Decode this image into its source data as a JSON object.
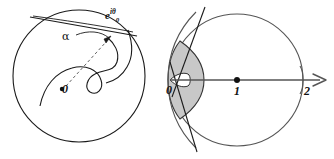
{
  "figure": {
    "background_color": "#ffffff",
    "stroke_color": "#1a1a1a",
    "shade_color": "#c8c8c8",
    "axis_color": "#555555",
    "left_panel": {
      "name": "unit-disk-with-spiral-and-tangent",
      "labels": {
        "origin": "0",
        "angle": "α",
        "boundary_point_base": "e",
        "boundary_point_exp_i": "i",
        "boundary_point_exp_theta": "θ",
        "boundary_point_exp_sub": "0"
      },
      "circle": {
        "cx": 79,
        "cy": 76,
        "r": 66
      },
      "origin_dot": {
        "cx": 62,
        "cy": 89
      }
    },
    "right_panel": {
      "name": "shifted-disk-with-real-axis",
      "labels": {
        "zero": "0",
        "one": "1",
        "two": "2"
      },
      "circle": {
        "cx": 237,
        "cy": 80,
        "r": 66
      },
      "center_dot": {
        "cx": 237,
        "cy": 80
      },
      "axis": {
        "x1": 170,
        "y1": 80,
        "x2": 326,
        "y2": 80
      },
      "tick_two_x": 304,
      "shaded_region_fill": "#c8c8c8"
    }
  }
}
